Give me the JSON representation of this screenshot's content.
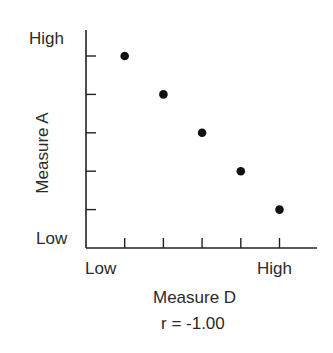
{
  "chart_data": {
    "type": "scatter",
    "title": "",
    "xlabel": "Measure D",
    "ylabel": "Measure A",
    "x_tick_labels": {
      "low": "Low",
      "high": "High"
    },
    "y_tick_labels": {
      "low": "Low",
      "high": "High"
    },
    "annotation": "r = -1.00",
    "grid": false,
    "xlim": [
      0,
      6
    ],
    "ylim": [
      0,
      6
    ],
    "x": [
      1,
      2,
      3,
      4,
      5
    ],
    "y": [
      5,
      4,
      3,
      2,
      1
    ],
    "points": [
      {
        "x": 1,
        "y": 5
      },
      {
        "x": 2,
        "y": 4
      },
      {
        "x": 3,
        "y": 3
      },
      {
        "x": 4,
        "y": 2
      },
      {
        "x": 5,
        "y": 1
      }
    ],
    "marker_color": "#111111"
  },
  "labels": {
    "y_high": "High",
    "y_low": "Low",
    "x_low": "Low",
    "x_high": "High",
    "x_title": "Measure D",
    "y_title": "Measure A",
    "r_value": "r = -1.00"
  }
}
